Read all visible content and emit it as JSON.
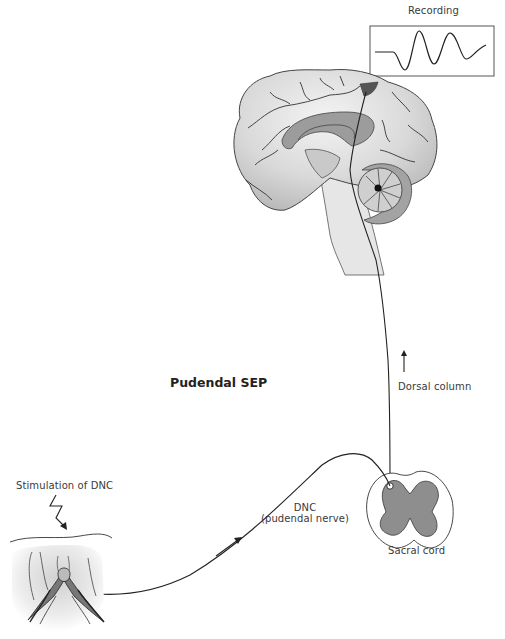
{
  "figure": {
    "title": "Pudendal SEP",
    "labels": {
      "recording": "Recording",
      "dorsal_column": "Dorsal column",
      "sacral_cord": "Sacral cord",
      "dnc_line1": "DNC",
      "dnc_line2": "(pudendal nerve)",
      "stimulation": "Stimulation of DNC"
    },
    "colors": {
      "line": "#222222",
      "brain_fill": "#d6d6d6",
      "brain_dark": "#9a9a9a",
      "cortex_target": "#555555",
      "gray_matter": "#8e8e8e",
      "background": "#ffffff"
    },
    "icons": {
      "recording_waveform": "waveform-icon",
      "lightning_stimulus": "lightning-bolt-icon",
      "ascending_arrow": "arrow-up-icon",
      "nerve_direction_arrow": "arrow-up-right-icon"
    }
  }
}
